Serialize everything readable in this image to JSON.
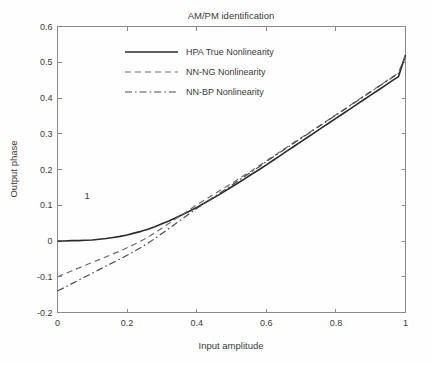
{
  "figure": {
    "background_color": "#fefefe",
    "frame_color": "#8a8a8a",
    "text_color": "#3a3a3a"
  },
  "annotation": {
    "label": "1"
  },
  "chart_data": {
    "type": "line",
    "title": "AM/PM identification",
    "xlabel": "Input amplitude",
    "ylabel": "Output phase",
    "xlim": [
      0,
      1
    ],
    "ylim": [
      -0.2,
      0.6
    ],
    "xticks": [
      0,
      0.2,
      0.4,
      0.6,
      0.8,
      1
    ],
    "xtick_labels": [
      "0",
      "0.2",
      "0.4",
      "0.6",
      "0.8",
      "1"
    ],
    "yticks": [
      -0.2,
      -0.1,
      0,
      0.1,
      0.2,
      0.3,
      0.4,
      0.5,
      0.6
    ],
    "ytick_labels": [
      "-0.2",
      "-0.1",
      "0",
      "0.1",
      "0.2",
      "0.3",
      "0.4",
      "0.5",
      "0.6"
    ],
    "grid": false,
    "legend_position": "upper center",
    "annotations": [
      {
        "text": "1",
        "x": 0.085,
        "y": 0.118
      }
    ],
    "x": [
      0,
      0.02,
      0.04,
      0.06,
      0.08,
      0.1,
      0.12,
      0.14,
      0.16,
      0.18,
      0.2,
      0.22,
      0.24,
      0.26,
      0.28,
      0.3,
      0.32,
      0.34,
      0.36,
      0.38,
      0.4,
      0.42,
      0.44,
      0.46,
      0.48,
      0.5,
      0.52,
      0.54,
      0.56,
      0.58,
      0.6,
      0.62,
      0.64,
      0.66,
      0.68,
      0.7,
      0.72,
      0.74,
      0.76,
      0.78,
      0.8,
      0.82,
      0.84,
      0.86,
      0.88,
      0.9,
      0.92,
      0.94,
      0.96,
      0.98,
      1
    ],
    "series": [
      {
        "name": "HPA True Nonlinearity",
        "style": "solid",
        "color": "#2b2b2b",
        "width": 1.6,
        "values": [
          0.0,
          0.0,
          0.001,
          0.001,
          0.002,
          0.003,
          0.005,
          0.007,
          0.01,
          0.013,
          0.017,
          0.022,
          0.027,
          0.033,
          0.04,
          0.048,
          0.056,
          0.065,
          0.074,
          0.084,
          0.094,
          0.105,
          0.116,
          0.127,
          0.139,
          0.151,
          0.163,
          0.175,
          0.188,
          0.2,
          0.213,
          0.226,
          0.239,
          0.252,
          0.265,
          0.278,
          0.291,
          0.304,
          0.317,
          0.33,
          0.343,
          0.356,
          0.369,
          0.382,
          0.395,
          0.408,
          0.421,
          0.434,
          0.447,
          0.46,
          0.52
        ]
      },
      {
        "name": "NN-NG Nonlinearity",
        "style": "dashed",
        "color": "#6a6a6a",
        "width": 1.2,
        "values": [
          -0.1,
          -0.092,
          -0.084,
          -0.076,
          -0.068,
          -0.06,
          -0.052,
          -0.044,
          -0.036,
          -0.028,
          -0.019,
          -0.01,
          0.0,
          0.011,
          0.023,
          0.036,
          0.049,
          0.062,
          0.075,
          0.088,
          0.101,
          0.113,
          0.125,
          0.137,
          0.149,
          0.161,
          0.173,
          0.186,
          0.198,
          0.211,
          0.224,
          0.237,
          0.25,
          0.263,
          0.276,
          0.289,
          0.301,
          0.314,
          0.327,
          0.34,
          0.353,
          0.366,
          0.379,
          0.392,
          0.405,
          0.418,
          0.431,
          0.444,
          0.457,
          0.47,
          0.521
        ]
      },
      {
        "name": "NN-BP Nonlinearity",
        "style": "dashdot",
        "color": "#4a4a4a",
        "width": 1.2,
        "values": [
          -0.14,
          -0.13,
          -0.12,
          -0.11,
          -0.1,
          -0.09,
          -0.08,
          -0.07,
          -0.06,
          -0.05,
          -0.04,
          -0.029,
          -0.018,
          -0.006,
          0.007,
          0.021,
          0.035,
          0.049,
          0.063,
          0.077,
          0.091,
          0.104,
          0.117,
          0.13,
          0.143,
          0.156,
          0.169,
          0.182,
          0.195,
          0.208,
          0.222,
          0.235,
          0.248,
          0.261,
          0.274,
          0.287,
          0.3,
          0.313,
          0.326,
          0.339,
          0.352,
          0.365,
          0.378,
          0.391,
          0.404,
          0.417,
          0.43,
          0.443,
          0.456,
          0.469,
          0.519
        ]
      }
    ]
  }
}
